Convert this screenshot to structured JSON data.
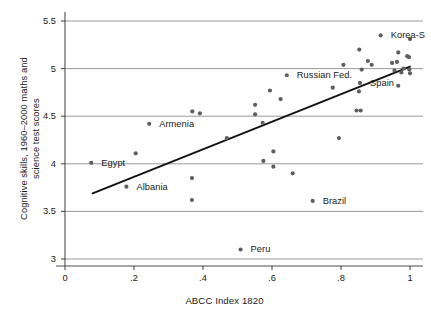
{
  "chart_data": {
    "type": "scatter",
    "title": "",
    "xlabel": "ABCC Index 1820",
    "ylabel_line1": "Cognitive skills, 1960–2000 maths and",
    "ylabel_line2": "science test scores",
    "xlim": [
      0,
      1.04
    ],
    "ylim": [
      3,
      5.5
    ],
    "xticks": [
      0,
      0.2,
      0.4,
      0.6,
      0.8,
      1
    ],
    "xticklabels": [
      "0",
      ".2",
      ".4",
      ".6",
      ".8",
      "1"
    ],
    "yticks": [
      3,
      3.5,
      4,
      4.5,
      5,
      5.5
    ],
    "yticklabels": [
      "3",
      "3.5",
      "4",
      "4.5",
      "5",
      "5.5"
    ],
    "grid": "horizontal",
    "legend": "none",
    "marker_color": "#5e5e63",
    "line_color": "#111111",
    "axis_color": "#4d4d4d",
    "grid_color": "#8c8c8c",
    "points": [
      {
        "x": 0.076,
        "y": 4.01,
        "label": "Egypt",
        "lx": 10,
        "ly": 0
      },
      {
        "x": 0.178,
        "y": 3.76,
        "label": "Albania",
        "lx": 10,
        "ly": 0
      },
      {
        "x": 0.205,
        "y": 4.11,
        "label": ""
      },
      {
        "x": 0.244,
        "y": 4.42,
        "label": "Armenia",
        "lx": 10,
        "ly": 0
      },
      {
        "x": 0.368,
        "y": 3.85,
        "label": ""
      },
      {
        "x": 0.368,
        "y": 3.62,
        "label": ""
      },
      {
        "x": 0.369,
        "y": 4.55,
        "label": ""
      },
      {
        "x": 0.391,
        "y": 4.53,
        "label": ""
      },
      {
        "x": 0.469,
        "y": 4.27,
        "label": ""
      },
      {
        "x": 0.509,
        "y": 3.1,
        "label": "Peru",
        "lx": 10,
        "ly": 0
      },
      {
        "x": 0.551,
        "y": 4.62,
        "label": ""
      },
      {
        "x": 0.551,
        "y": 4.52,
        "label": ""
      },
      {
        "x": 0.573,
        "y": 4.43,
        "label": ""
      },
      {
        "x": 0.575,
        "y": 4.03,
        "label": ""
      },
      {
        "x": 0.594,
        "y": 4.77,
        "label": ""
      },
      {
        "x": 0.604,
        "y": 4.13,
        "label": ""
      },
      {
        "x": 0.604,
        "y": 3.97,
        "label": ""
      },
      {
        "x": 0.625,
        "y": 4.68,
        "label": ""
      },
      {
        "x": 0.643,
        "y": 4.93,
        "label": "Russian Fed.",
        "lx": 10,
        "ly": 0
      },
      {
        "x": 0.66,
        "y": 3.9,
        "label": ""
      },
      {
        "x": 0.718,
        "y": 3.61,
        "label": "Brazil",
        "lx": 10,
        "ly": 0
      },
      {
        "x": 0.776,
        "y": 4.8,
        "label": ""
      },
      {
        "x": 0.794,
        "y": 4.27,
        "label": ""
      },
      {
        "x": 0.807,
        "y": 5.04,
        "label": ""
      },
      {
        "x": 0.845,
        "y": 4.56,
        "label": ""
      },
      {
        "x": 0.857,
        "y": 4.56,
        "label": ""
      },
      {
        "x": 0.853,
        "y": 5.2,
        "label": ""
      },
      {
        "x": 0.852,
        "y": 4.76,
        "label": ""
      },
      {
        "x": 0.855,
        "y": 4.85,
        "label": "Spain",
        "lx": 10,
        "ly": 0
      },
      {
        "x": 0.86,
        "y": 4.99,
        "label": ""
      },
      {
        "x": 0.878,
        "y": 5.08,
        "label": ""
      },
      {
        "x": 0.889,
        "y": 5.04,
        "label": ""
      },
      {
        "x": 0.915,
        "y": 5.35,
        "label": "Korea-S",
        "lx": 10,
        "ly": 0
      },
      {
        "x": 0.948,
        "y": 5.06,
        "label": ""
      },
      {
        "x": 0.955,
        "y": 4.98,
        "label": ""
      },
      {
        "x": 0.962,
        "y": 5.07,
        "label": ""
      },
      {
        "x": 0.966,
        "y": 5.17,
        "label": ""
      },
      {
        "x": 0.966,
        "y": 4.82,
        "label": ""
      },
      {
        "x": 0.975,
        "y": 4.96,
        "label": ""
      },
      {
        "x": 0.981,
        "y": 5.0,
        "label": ""
      },
      {
        "x": 0.992,
        "y": 5.13,
        "label": ""
      },
      {
        "x": 0.997,
        "y": 5.12,
        "label": ""
      },
      {
        "x": 0.998,
        "y": 4.99,
        "label": ""
      },
      {
        "x": 1.0,
        "y": 4.95,
        "label": ""
      },
      {
        "x": 1.0,
        "y": 5.31,
        "label": ""
      }
    ],
    "fit_line": {
      "x0": 0.08,
      "y0": 3.69,
      "x1": 1.0,
      "y1": 5.02
    }
  }
}
